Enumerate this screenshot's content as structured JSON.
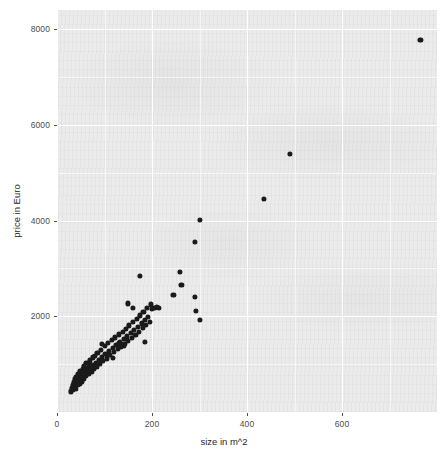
{
  "chart_data": {
    "type": "scatter",
    "title": "",
    "xlabel": "size in m^2",
    "ylabel": "price in Euro",
    "xlim": [
      0,
      800
    ],
    "ylim": [
      0,
      8400
    ],
    "xticks": [
      0,
      200,
      400,
      600
    ],
    "yticks": [
      2000,
      4000,
      6000,
      8000
    ],
    "xtick_labels": [
      "0",
      "200",
      "400",
      "600"
    ],
    "ytick_labels": [
      "2000",
      "4000",
      "6000",
      "8000"
    ],
    "grid": true,
    "grid_major_color": "#ffffff",
    "grid_minor_color": "#ffffff",
    "panel_background": "#ebebeb",
    "point_color": "#1a1a1a",
    "point_size": 5.2,
    "n_points": 112,
    "legend": null,
    "series": [
      {
        "name": "apartments",
        "points": [
          [
            30,
            430
          ],
          [
            32,
            500
          ],
          [
            33,
            560
          ],
          [
            34,
            470
          ],
          [
            35,
            620
          ],
          [
            36,
            530
          ],
          [
            37,
            700
          ],
          [
            38,
            590
          ],
          [
            39,
            650
          ],
          [
            40,
            480
          ],
          [
            41,
            740
          ],
          [
            42,
            620
          ],
          [
            43,
            560
          ],
          [
            44,
            690
          ],
          [
            45,
            800
          ],
          [
            46,
            640
          ],
          [
            47,
            720
          ],
          [
            48,
            590
          ],
          [
            49,
            860
          ],
          [
            50,
            700
          ],
          [
            52,
            760
          ],
          [
            53,
            640
          ],
          [
            54,
            900
          ],
          [
            55,
            820
          ],
          [
            56,
            700
          ],
          [
            57,
            960
          ],
          [
            58,
            780
          ],
          [
            60,
            880
          ],
          [
            61,
            760
          ],
          [
            62,
            1020
          ],
          [
            63,
            840
          ],
          [
            65,
            920
          ],
          [
            66,
            790
          ],
          [
            68,
            1000
          ],
          [
            69,
            870
          ],
          [
            70,
            1080
          ],
          [
            72,
            930
          ],
          [
            73,
            840
          ],
          [
            75,
            1140
          ],
          [
            76,
            990
          ],
          [
            78,
            900
          ],
          [
            80,
            1180
          ],
          [
            82,
            1020
          ],
          [
            84,
            950
          ],
          [
            85,
            1240
          ],
          [
            88,
            1090
          ],
          [
            90,
            1000
          ],
          [
            92,
            1300
          ],
          [
            95,
            1150
          ],
          [
            97,
            1060
          ],
          [
            100,
            1380
          ],
          [
            102,
            1220
          ],
          [
            105,
            1120
          ],
          [
            108,
            1440
          ],
          [
            110,
            1280
          ],
          [
            112,
            1190
          ],
          [
            115,
            1500
          ],
          [
            118,
            1340
          ],
          [
            120,
            1250
          ],
          [
            122,
            1560
          ],
          [
            125,
            1400
          ],
          [
            128,
            1310
          ],
          [
            130,
            1620
          ],
          [
            132,
            1460
          ],
          [
            135,
            1370
          ],
          [
            138,
            1680
          ],
          [
            140,
            1520
          ],
          [
            142,
            1430
          ],
          [
            145,
            1740
          ],
          [
            148,
            1580
          ],
          [
            150,
            1490
          ],
          [
            152,
            1810
          ],
          [
            155,
            1650
          ],
          [
            158,
            1550
          ],
          [
            160,
            1880
          ],
          [
            162,
            1710
          ],
          [
            165,
            1610
          ],
          [
            168,
            1950
          ],
          [
            170,
            1780
          ],
          [
            172,
            1680
          ],
          [
            175,
            2020
          ],
          [
            178,
            1850
          ],
          [
            180,
            1750
          ],
          [
            182,
            2100
          ],
          [
            185,
            1920
          ],
          [
            188,
            1820
          ],
          [
            190,
            2180
          ],
          [
            192,
            1990
          ],
          [
            195,
            1890
          ],
          [
            198,
            2250
          ],
          [
            150,
            2270
          ],
          [
            160,
            2180
          ],
          [
            175,
            2850
          ],
          [
            200,
            2150
          ],
          [
            205,
            2180
          ],
          [
            210,
            2200
          ],
          [
            215,
            2170
          ],
          [
            130,
            1450
          ],
          [
            140,
            1380
          ],
          [
            95,
            1430
          ],
          [
            118,
            1130
          ],
          [
            185,
            1460
          ],
          [
            245,
            2450
          ],
          [
            258,
            2920
          ],
          [
            262,
            2650
          ],
          [
            290,
            2400
          ],
          [
            292,
            2120
          ],
          [
            300,
            1930
          ],
          [
            290,
            3550
          ],
          [
            300,
            4020
          ],
          [
            435,
            4450
          ],
          [
            490,
            5400
          ],
          [
            765,
            7780
          ]
        ]
      }
    ]
  },
  "axes": {
    "x_title": "size in m^2",
    "y_title": "price in Euro"
  }
}
